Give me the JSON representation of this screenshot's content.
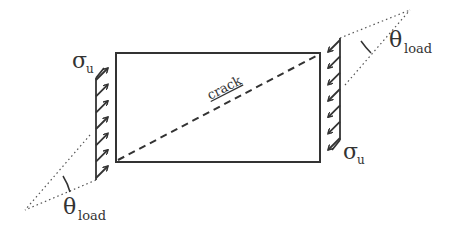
{
  "diagram": {
    "crack_label": "crack",
    "stress_label": "σ",
    "stress_subscript": "u",
    "angle_label": "θ",
    "angle_subscript": "load",
    "arrow_count_per_side": 7,
    "line_color": "#333333"
  }
}
